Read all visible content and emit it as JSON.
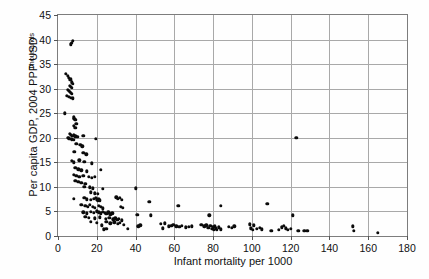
{
  "chart_data": {
    "type": "scatter",
    "title": "",
    "xlabel": "Infant mortality per 1000",
    "ylabel": "Per capita GDP, 2004 PPP USD",
    "y_unit_label": "Thousands",
    "xlim": [
      0,
      180
    ],
    "ylim": [
      0,
      45
    ],
    "xticks": [
      0,
      20,
      40,
      60,
      80,
      100,
      120,
      140,
      160,
      180
    ],
    "yticks": [
      0,
      5,
      10,
      15,
      20,
      25,
      30,
      35,
      40,
      45
    ],
    "grid": "both",
    "legend": "none",
    "marker": "filled-circle",
    "marker_color": "#0b0b0b",
    "grid_color": "#a9a9a9",
    "axis_color": "#7d7d7d",
    "points": [
      [
        6.5,
        39.0
      ],
      [
        7.0,
        39.3
      ],
      [
        7.5,
        39.7
      ],
      [
        4.0,
        33.0
      ],
      [
        5.0,
        32.6
      ],
      [
        5.5,
        32.2
      ],
      [
        6.0,
        31.8
      ],
      [
        6.5,
        31.9
      ],
      [
        7.0,
        31.3
      ],
      [
        7.5,
        31.0
      ],
      [
        6.0,
        30.6
      ],
      [
        6.5,
        30.4
      ],
      [
        7.0,
        30.2
      ],
      [
        5.0,
        29.8
      ],
      [
        5.5,
        29.6
      ],
      [
        6.0,
        29.4
      ],
      [
        6.5,
        29.2
      ],
      [
        7.0,
        29.0
      ],
      [
        4.5,
        28.6
      ],
      [
        5.5,
        28.4
      ],
      [
        6.5,
        28.2
      ],
      [
        7.5,
        28.0
      ],
      [
        3.5,
        25.0
      ],
      [
        8.0,
        24.2
      ],
      [
        8.5,
        23.9
      ],
      [
        9.0,
        23.6
      ],
      [
        9.5,
        22.8
      ],
      [
        8.0,
        22.4
      ],
      [
        9.0,
        22.0
      ],
      [
        6.0,
        20.8
      ],
      [
        6.5,
        20.6
      ],
      [
        7.0,
        20.4
      ],
      [
        8.0,
        20.5
      ],
      [
        9.0,
        20.3
      ],
      [
        5.0,
        20.0
      ],
      [
        5.5,
        19.9
      ],
      [
        6.0,
        19.8
      ],
      [
        7.0,
        19.7
      ],
      [
        8.0,
        19.6
      ],
      [
        10.0,
        20.2
      ],
      [
        13.0,
        20.4
      ],
      [
        19.5,
        19.8
      ],
      [
        9.5,
        18.8
      ],
      [
        11.5,
        18.6
      ],
      [
        12.5,
        18.3
      ],
      [
        8.5,
        17.2
      ],
      [
        13.0,
        16.9
      ],
      [
        14.5,
        16.6
      ],
      [
        7.0,
        15.3
      ],
      [
        8.0,
        15.0
      ],
      [
        11.0,
        15.4
      ],
      [
        13.5,
        15.1
      ],
      [
        17.5,
        14.8
      ],
      [
        9.0,
        13.9
      ],
      [
        10.5,
        13.6
      ],
      [
        12.0,
        13.4
      ],
      [
        15.0,
        13.2
      ],
      [
        22.0,
        13.5
      ],
      [
        8.0,
        12.4
      ],
      [
        9.5,
        12.2
      ],
      [
        11.0,
        12.0
      ],
      [
        13.0,
        12.3
      ],
      [
        16.0,
        12.1
      ],
      [
        17.5,
        11.8
      ],
      [
        19.0,
        12.0
      ],
      [
        9.0,
        11.2
      ],
      [
        10.5,
        11.0
      ],
      [
        12.0,
        10.8
      ],
      [
        14.0,
        10.6
      ],
      [
        13.5,
        10.0
      ],
      [
        16.5,
        9.9
      ],
      [
        18.0,
        9.7
      ],
      [
        23.0,
        9.6
      ],
      [
        40.0,
        9.7
      ],
      [
        17.0,
        8.9
      ],
      [
        19.0,
        8.7
      ],
      [
        20.5,
        8.6
      ],
      [
        8.0,
        7.6
      ],
      [
        13.5,
        7.8
      ],
      [
        15.0,
        7.5
      ],
      [
        17.0,
        7.4
      ],
      [
        18.5,
        7.6
      ],
      [
        19.5,
        7.8
      ],
      [
        20.0,
        7.5
      ],
      [
        20.5,
        7.2
      ],
      [
        21.0,
        7.6
      ],
      [
        21.5,
        7.3
      ],
      [
        30.0,
        7.9
      ],
      [
        31.0,
        7.6
      ],
      [
        32.0,
        7.8
      ],
      [
        33.0,
        7.4
      ],
      [
        47.0,
        7.0
      ],
      [
        62.0,
        6.2
      ],
      [
        84.0,
        6.2
      ],
      [
        12.0,
        6.3
      ],
      [
        14.0,
        6.1
      ],
      [
        15.5,
        5.9
      ],
      [
        16.5,
        6.4
      ],
      [
        18.0,
        6.0
      ],
      [
        19.0,
        5.8
      ],
      [
        21.0,
        6.2
      ],
      [
        22.0,
        5.9
      ],
      [
        23.0,
        5.6
      ],
      [
        32.5,
        6.0
      ],
      [
        33.5,
        5.7
      ],
      [
        13.0,
        4.8
      ],
      [
        15.0,
        4.6
      ],
      [
        17.0,
        4.9
      ],
      [
        18.5,
        4.7
      ],
      [
        20.0,
        5.0
      ],
      [
        21.0,
        4.8
      ],
      [
        22.0,
        4.6
      ],
      [
        23.0,
        4.9
      ],
      [
        24.0,
        4.7
      ],
      [
        25.0,
        4.5
      ],
      [
        26.0,
        4.8
      ],
      [
        27.0,
        4.4
      ],
      [
        28.0,
        4.6
      ],
      [
        41.0,
        4.3
      ],
      [
        48.0,
        4.2
      ],
      [
        78.0,
        4.2
      ],
      [
        121.0,
        4.2
      ],
      [
        14.0,
        3.9
      ],
      [
        16.0,
        3.7
      ],
      [
        19.0,
        3.6
      ],
      [
        21.5,
        3.8
      ],
      [
        24.5,
        3.5
      ],
      [
        26.5,
        3.7
      ],
      [
        28.5,
        3.4
      ],
      [
        29.5,
        3.6
      ],
      [
        30.5,
        3.3
      ],
      [
        31.5,
        3.5
      ],
      [
        33.0,
        3.2
      ],
      [
        17.0,
        2.9
      ],
      [
        20.0,
        2.7
      ],
      [
        22.5,
        2.2
      ],
      [
        25.0,
        2.9
      ],
      [
        27.0,
        2.6
      ],
      [
        29.0,
        2.8
      ],
      [
        31.0,
        2.5
      ],
      [
        32.0,
        2.7
      ],
      [
        34.0,
        2.3
      ],
      [
        41.5,
        2.0
      ],
      [
        42.5,
        2.2
      ],
      [
        53.0,
        2.5
      ],
      [
        54.0,
        1.6
      ],
      [
        55.0,
        2.6
      ],
      [
        57.0,
        2.0
      ],
      [
        58.5,
        2.1
      ],
      [
        59.5,
        2.3
      ],
      [
        61.0,
        2.0
      ],
      [
        62.5,
        1.9
      ],
      [
        64.0,
        2.1
      ],
      [
        66.0,
        1.8
      ],
      [
        67.5,
        1.9
      ],
      [
        69.0,
        2.0
      ],
      [
        74.0,
        2.3
      ],
      [
        75.5,
        2.0
      ],
      [
        76.5,
        2.2
      ],
      [
        77.5,
        1.7
      ],
      [
        78.5,
        2.1
      ],
      [
        79.5,
        1.5
      ],
      [
        80.0,
        1.9
      ],
      [
        80.5,
        1.3
      ],
      [
        81.0,
        2.0
      ],
      [
        81.5,
        1.6
      ],
      [
        82.0,
        1.2
      ],
      [
        83.0,
        1.8
      ],
      [
        84.0,
        1.4
      ],
      [
        88.0,
        1.9
      ],
      [
        89.5,
        1.7
      ],
      [
        91.0,
        2.0
      ],
      [
        99.0,
        2.4
      ],
      [
        99.5,
        1.6
      ],
      [
        100.5,
        1.2
      ],
      [
        101.0,
        2.2
      ],
      [
        102.5,
        1.5
      ],
      [
        104.0,
        1.7
      ],
      [
        105.0,
        1.4
      ],
      [
        110.0,
        1.0
      ],
      [
        114.0,
        1.3
      ],
      [
        115.5,
        1.8
      ],
      [
        116.5,
        2.1
      ],
      [
        117.5,
        1.6
      ],
      [
        118.5,
        1.2
      ],
      [
        120.0,
        1.5
      ],
      [
        124.0,
        1.0
      ],
      [
        127.0,
        1.0
      ],
      [
        128.5,
        1.0
      ],
      [
        123.0,
        20.0
      ],
      [
        108.0,
        6.5
      ],
      [
        152.0,
        2.0
      ],
      [
        152.5,
        1.0
      ],
      [
        165.0,
        0.6
      ],
      [
        25.0,
        1.5
      ],
      [
        36.0,
        1.5
      ],
      [
        23.5,
        1.4
      ]
    ]
  }
}
